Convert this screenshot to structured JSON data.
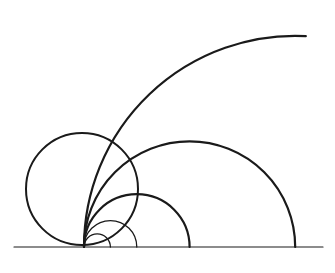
{
  "diagram": {
    "title": "",
    "line_color": "#1a1a1a",
    "background": "#ffffff",
    "tangent_point_label": "",
    "elements": [
      {
        "id": "baseline",
        "kind": "line"
      },
      {
        "id": "circle-left",
        "kind": "full-circle"
      },
      {
        "id": "arc-huge",
        "kind": "arc",
        "relative_size": 16
      },
      {
        "id": "semicircle-large",
        "kind": "semicircle",
        "relative_size": 8
      },
      {
        "id": "semicircle-medium",
        "kind": "semicircle",
        "relative_size": 4
      },
      {
        "id": "semicircle-small",
        "kind": "semicircle",
        "relative_size": 2
      },
      {
        "id": "semicircle-tiny",
        "kind": "semicircle",
        "relative_size": 1
      }
    ]
  }
}
